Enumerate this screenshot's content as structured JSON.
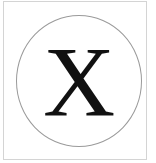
{
  "symbol": {
    "letter": "X",
    "color": "#111111"
  },
  "colors": {
    "frame_border": "#d4d4d4",
    "circle_border": "#9a9a9a",
    "background": "#ffffff"
  }
}
